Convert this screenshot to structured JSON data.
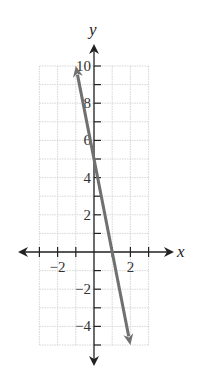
{
  "chart_data": {
    "type": "line",
    "title": "",
    "xlabel": "x",
    "ylabel": "y",
    "xlim": [
      -3,
      3
    ],
    "ylim": [
      -5,
      10
    ],
    "grid": true,
    "x_ticks": [
      -3,
      -2,
      -1,
      1,
      2,
      3
    ],
    "x_tick_labels": [
      {
        "value": -2,
        "label": "−2"
      },
      {
        "value": 2,
        "label": "2"
      }
    ],
    "y_ticks": [
      -5,
      -4,
      -3,
      -2,
      -1,
      1,
      2,
      3,
      4,
      5,
      6,
      7,
      8,
      9,
      10
    ],
    "y_tick_labels": [
      {
        "value": 10,
        "label": "10"
      },
      {
        "value": 8,
        "label": "8"
      },
      {
        "value": 6,
        "label": "6"
      },
      {
        "value": 4,
        "label": "4"
      },
      {
        "value": 2,
        "label": "2"
      },
      {
        "value": -2,
        "label": "−2"
      },
      {
        "value": -4,
        "label": "−4"
      }
    ],
    "series": [
      {
        "name": "y = -5x + 5",
        "x": [
          -1,
          2
        ],
        "y": [
          10,
          -5
        ],
        "arrows_both_ends": true,
        "color": "#707070"
      }
    ],
    "legend": null
  },
  "colors": {
    "axis": "#222222",
    "grid": "#cccccc",
    "line": "#707070"
  }
}
